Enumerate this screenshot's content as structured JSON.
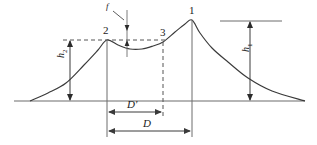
{
  "figure": {
    "type": "technical-line-diagram",
    "title": "",
    "background_color": "#ffffff",
    "line_color": "#4a4a4a",
    "curve_color": "#3a3a3a",
    "dash_color": "#555555",
    "text_color": "#1a1a1a",
    "width": 317,
    "height": 145
  },
  "point_labels": {
    "peak_main": "1",
    "peak_secondary": "2",
    "inflection": "3"
  },
  "height_dimensions": {
    "left": {
      "symbol": "h",
      "subscript": "2",
      "text": "h2"
    },
    "right": {
      "symbol": "h",
      "subscript": "1",
      "text": "h1"
    }
  },
  "distance_dimensions": {
    "inner": {
      "text": "D'",
      "symbol": "D",
      "prime": "'"
    },
    "outer": {
      "text": "D",
      "symbol": "D",
      "prime": ""
    }
  },
  "sag_annotation": {
    "text": "f",
    "description": "sag-between-peaks"
  },
  "axis": {
    "baseline": "ground-line"
  },
  "chart_data": {
    "type": "line",
    "title": "",
    "xlabel": "",
    "ylabel": "",
    "grid": false,
    "legend": false,
    "xlim": [
      0,
      317
    ],
    "ylim": [
      0,
      145
    ],
    "series": [
      {
        "name": "profile-curve",
        "comment": "twin-peak drawdown / cone profile, left foot -> peak2 -> sag -> point3 -> peak1 -> right foot",
        "points": [
          [
            30,
            101
          ],
          [
            48,
            93
          ],
          [
            66,
            83
          ],
          [
            84,
            65
          ],
          [
            98,
            50
          ],
          [
            107,
            40
          ],
          [
            118,
            45
          ],
          [
            130,
            49
          ],
          [
            142,
            49
          ],
          [
            153,
            46
          ],
          [
            163,
            42
          ],
          [
            175,
            32
          ],
          [
            185,
            24
          ],
          [
            192,
            20
          ],
          [
            200,
            33
          ],
          [
            212,
            48
          ],
          [
            228,
            62
          ],
          [
            248,
            78
          ],
          [
            272,
            91
          ],
          [
            305,
            101
          ]
        ]
      }
    ],
    "markers": [
      {
        "label": "2",
        "x": 107,
        "y": 40
      },
      {
        "label": "3",
        "x": 163,
        "y": 42
      },
      {
        "label": "1",
        "x": 192,
        "y": 20
      }
    ],
    "annotations": [
      {
        "label": "h2",
        "type": "vertical-dimension",
        "x": 70,
        "y_top": 40,
        "y_bottom": 101
      },
      {
        "label": "h1",
        "type": "vertical-dimension",
        "x": 250,
        "y_top": 21,
        "y_bottom": 101
      },
      {
        "label": "D'",
        "type": "horizontal-dimension",
        "y": 112,
        "x_left": 107,
        "x_right": 163
      },
      {
        "label": "D",
        "type": "horizontal-dimension",
        "y": 131,
        "x_left": 107,
        "x_right": 192
      },
      {
        "label": "f",
        "type": "vertical-dimension-small",
        "x": 127,
        "y_top": 40,
        "y_bottom": 49
      }
    ]
  }
}
